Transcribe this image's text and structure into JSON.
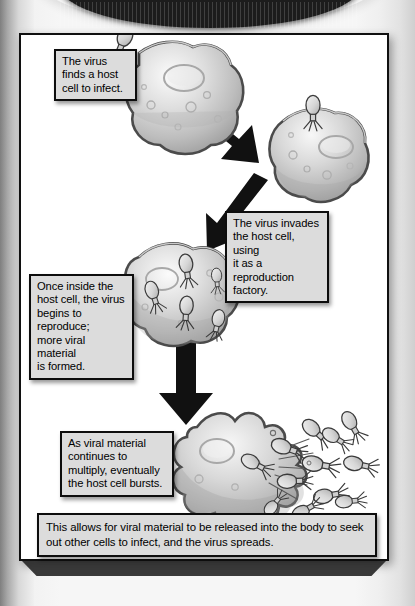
{
  "document": {
    "type": "textbook-diagram",
    "title_visible": false,
    "background_color": "#f2f2f2",
    "frame_border_color": "#101010",
    "caption_fill": "#dcdcdc",
    "cell_color": "#b9b9b9",
    "arrow_color": "#111111"
  },
  "captions": {
    "step1": "The virus\nfinds a host\ncell to infect.",
    "step2": "The virus invades\nthe host cell, using\nit as a reproduction\nfactory.",
    "step3": "Once inside the\nhost cell, the virus\nbegins to reproduce;\nmore viral material\nis formed.",
    "step4": "As viral material\ncontinues to\nmultiply, eventually\nthe host cell bursts.",
    "summary": "This allows for viral material to be released into the body to seek out other cells to infect, and the virus spreads."
  },
  "stages": [
    {
      "id": "stage-1",
      "label": "virus approaches host cell",
      "virus_count": 1,
      "cell_state": "intact"
    },
    {
      "id": "stage-2",
      "label": "virus attached to host cell",
      "virus_count": 1,
      "cell_state": "infected"
    },
    {
      "id": "stage-3",
      "label": "viruses replicating inside host cell",
      "virus_count": 5,
      "cell_state": "replicating"
    },
    {
      "id": "stage-4",
      "label": "host cell bursts releasing viruses",
      "virus_count": 12,
      "cell_state": "lysed"
    }
  ],
  "arrows": [
    {
      "id": "arrow-1",
      "direction": "down-right"
    },
    {
      "id": "arrow-2",
      "direction": "down-left"
    },
    {
      "id": "arrow-3",
      "direction": "down"
    }
  ]
}
